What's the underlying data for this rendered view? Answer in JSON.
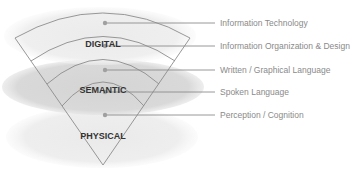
{
  "diagram": {
    "layers": [
      {
        "name": "DIGITAL",
        "x": 103,
        "y": 47
      },
      {
        "name": "SEMANTIC",
        "x": 103,
        "y": 93
      },
      {
        "name": "PHYSICAL",
        "x": 103,
        "y": 139
      }
    ],
    "annotations": [
      {
        "label": "Information Technology",
        "y": 23
      },
      {
        "label": "Information Organization & Design",
        "y": 46
      },
      {
        "label": "Written / Graphical Language",
        "y": 70
      },
      {
        "label": "Spoken Language",
        "y": 92
      },
      {
        "label": "Perception / Cognition",
        "y": 115
      }
    ],
    "colors": {
      "ellipse_light": "#ececec",
      "ellipse_mid": "#d8d8d8",
      "stroke": "#8c8c8c",
      "dot": "#a0a0a0",
      "label_text": "#333333",
      "annotation_text": "#8a8a8a"
    }
  }
}
